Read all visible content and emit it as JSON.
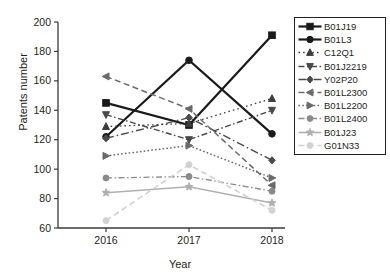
{
  "chart_data": {
    "type": "line",
    "title": "",
    "xlabel": "Year",
    "ylabel": "Patents number",
    "categories": [
      "2016",
      "2017",
      "2018"
    ],
    "x": [
      2016,
      2017,
      2018
    ],
    "xlim": [
      2015.6,
      2018.4
    ],
    "ylim": [
      60,
      200
    ],
    "yticks": [
      60,
      80,
      100,
      120,
      140,
      160,
      180,
      200
    ],
    "xticks": [
      "2016",
      "2017",
      "2018"
    ],
    "grid": false,
    "legend_position": "right",
    "series": [
      {
        "name": "B01J19",
        "values": [
          145,
          130,
          191
        ],
        "color": "#1a1a1a",
        "marker": "square",
        "dash": "solid",
        "width": 2.2
      },
      {
        "name": "B01L3",
        "values": [
          122,
          174,
          124
        ],
        "color": "#1a1a1a",
        "marker": "circle",
        "dash": "solid",
        "width": 2.2
      },
      {
        "name": "C12Q1",
        "values": [
          129,
          131,
          148
        ],
        "color": "#3d3d3d",
        "marker": "triangle-up",
        "dash": "dashdot-sparse",
        "width": 1.3
      },
      {
        "name": "B01J2219",
        "values": [
          137,
          120,
          140
        ],
        "color": "#4a4a4a",
        "marker": "triangle-down",
        "dash": "dashdot",
        "width": 1.4
      },
      {
        "name": "Y02P20",
        "values": [
          121,
          135,
          106
        ],
        "color": "#4a4a4a",
        "marker": "diamond",
        "dash": "dashdot-long",
        "width": 1.4
      },
      {
        "name": "B01L2300",
        "values": [
          163,
          141,
          89
        ],
        "color": "#6b6b6b",
        "marker": "triangle-left",
        "dash": "dashed",
        "width": 1.5
      },
      {
        "name": "B01L2200",
        "values": [
          109,
          116,
          94
        ],
        "color": "#6b6b6b",
        "marker": "triangle-right",
        "dash": "dotted",
        "width": 1.5
      },
      {
        "name": "B01L2400",
        "values": [
          94,
          95,
          85
        ],
        "color": "#8a8a8a",
        "marker": "circle",
        "dash": "dashdot",
        "width": 1.3
      },
      {
        "name": "B01J23",
        "values": [
          84,
          88,
          77
        ],
        "color": "#b0b0b0",
        "marker": "star",
        "dash": "solid",
        "width": 1.6
      },
      {
        "name": "G01N33",
        "values": [
          65,
          103,
          72
        ],
        "color": "#d2d2d2",
        "marker": "circle",
        "dash": "dashed",
        "width": 1.6
      }
    ]
  },
  "axes": {
    "ylabel": "Patents number",
    "xlabel": "Year",
    "ytick_labels": [
      "60",
      "80",
      "100",
      "120",
      "140",
      "160",
      "180",
      "200"
    ],
    "xtick_labels": [
      "2016",
      "2017",
      "2018"
    ]
  },
  "legend": {
    "items": [
      {
        "label": "B01J19"
      },
      {
        "label": "B01L3"
      },
      {
        "label": "C12Q1"
      },
      {
        "label": "B01J2219"
      },
      {
        "label": "Y02P20"
      },
      {
        "label": "B01L2300"
      },
      {
        "label": "B01L2200"
      },
      {
        "label": "B01L2400"
      },
      {
        "label": "B01J23"
      },
      {
        "label": "G01N33"
      }
    ]
  }
}
